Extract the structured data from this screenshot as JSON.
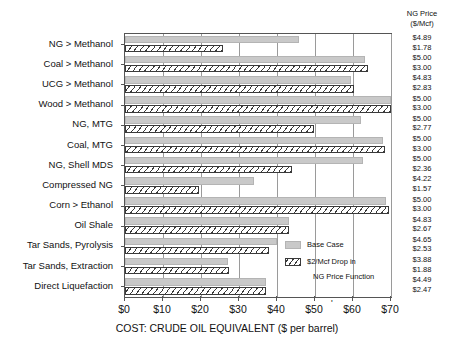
{
  "chart_data": {
    "type": "bar",
    "orientation": "horizontal",
    "title": "",
    "xlabel": "COST: CRUDE OIL EQUIVALENT ($ per barrel)",
    "ylabel": "",
    "xlim": [
      0,
      70
    ],
    "xticks": [
      0,
      10,
      20,
      30,
      40,
      50,
      60,
      70
    ],
    "xticklabels": [
      "$0",
      "$10",
      "$20",
      "$30",
      "$40",
      "$50",
      "$60",
      "$70"
    ],
    "grid": true,
    "legend_position": "inside-lower-right",
    "categories": [
      "NG > Methanol",
      "Coal > Methanol",
      "UCG > Methanol",
      "Wood > Methanol",
      "NG, MTG",
      "Coal, MTG",
      "NG, Shell MDS",
      "Compressed NG",
      "Corn > Ethanol",
      "Oil Shale",
      "Tar Sands, Pyrolysis",
      "Tar Sands, Extraction",
      "Direct Liquefaction"
    ],
    "series": [
      {
        "name": "Base Case",
        "values": [
          45.8,
          63.2,
          59.6,
          70.0,
          62.0,
          67.8,
          62.5,
          34.0,
          68.8,
          43.2,
          40.0,
          27.0,
          37.2
        ]
      },
      {
        "name": "$2/Mcf Drop in NG Price Function",
        "values": [
          25.8,
          64.0,
          60.2,
          70.0,
          49.8,
          68.4,
          44.0,
          19.4,
          69.4,
          43.2,
          38.0,
          27.4,
          37.2
        ]
      }
    ],
    "annotation_column": {
      "header_line1": "NG Price",
      "header_line2": "($/Mcf)",
      "rows": [
        {
          "base": "$4.89",
          "drop": "$1.78"
        },
        {
          "base": "$5.00",
          "drop": "$3.00"
        },
        {
          "base": "$4.83",
          "drop": "$2.83"
        },
        {
          "base": "$5.00",
          "drop": "$3.00"
        },
        {
          "base": "$5.00",
          "drop": "$2.77"
        },
        {
          "base": "$5.00",
          "drop": "$3.00"
        },
        {
          "base": "$5.00",
          "drop": "$2.36"
        },
        {
          "base": "$4.22",
          "drop": "$1.57"
        },
        {
          "base": "$5.00",
          "drop": "$3.00"
        },
        {
          "base": "$4.83",
          "drop": "$2.67"
        },
        {
          "base": "$4.65",
          "drop": "$2.53"
        },
        {
          "base": "$3.88",
          "drop": "$1.88"
        },
        {
          "base": "$4.49",
          "drop": "$2.47"
        }
      ]
    },
    "legend_entries": [
      {
        "label": "Base Case",
        "label2": ""
      },
      {
        "label": "$2/Mcf Drop in",
        "label2": "NG Price Function"
      }
    ],
    "colors": {
      "base_fill": "#c9c9c9",
      "base_edge": "#b4b4b4",
      "drop_fill": "#ffffff",
      "drop_edge": "#3a3a3a",
      "grid": "#9a9a9a",
      "axis": "#555555",
      "text": "#111111"
    },
    "stray_mark": "'"
  }
}
